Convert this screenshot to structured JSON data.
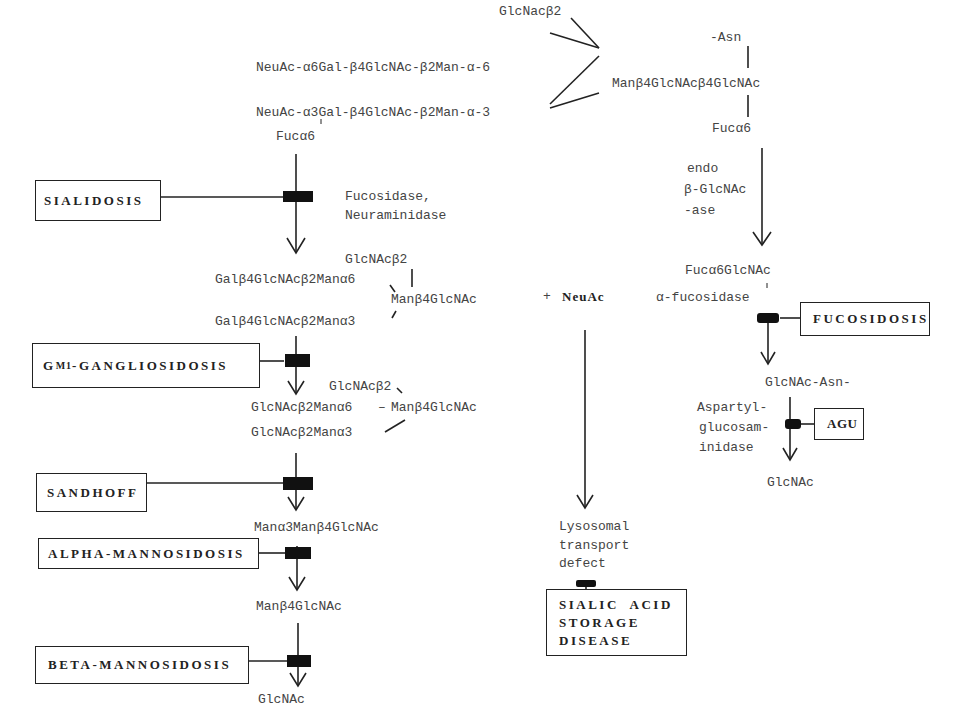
{
  "top": {
    "glcnac_b2": "GlcNacβ2",
    "branch6": "NeuAc-α6Gal-β4GlcNAc-β2Man-α-6",
    "branch3": "NeuAc-α3Gal-β4GlcNAc-β2Man-α-3",
    "fuc_a6_left": "Fucα6",
    "core": "Manβ4GlcNAcβ4GlcNAc",
    "asn": "-Asn",
    "fuc_a6_right": "Fucα6"
  },
  "enzymes": {
    "fucosidase": "Fucosidase,",
    "neuraminidase": "Neuraminidase",
    "endo1": "endo",
    "endo2": "β-GlcNAc",
    "endo3": "-ase",
    "alpha_fucosidase": "α-fucosidase",
    "aga1": "Aspartyl-",
    "aga2": "glucosam-",
    "aga3": "inidase",
    "lyso1": "Lysosomal",
    "lyso2": "transport",
    "lyso3": "defect"
  },
  "intermediates": {
    "s1_glcnac_b2": "GlcNAcβ2",
    "s1_branch6": "Galβ4GlcNAcβ2Manα6",
    "s1_core": "Manβ4GlcNAc",
    "s1_branch3": "Galβ4GlcNAcβ2Manα3",
    "plus_neuac_plus": "+",
    "plus_neuac": "NeuAc",
    "s2_glcnac_b2": "GlcNAcβ2",
    "s2_branch6": "GlcNAcβ2Manα6",
    "s2_dash": "–",
    "s2_core": "Manβ4GlcNAc",
    "s2_branch3": "GlcNAcβ2Manα3",
    "s3": "Manα3Manβ4GlcNAc",
    "s4": "Manβ4GlcNAc",
    "s5": "GlcNAc",
    "r1": "Fucα6GlcNAc",
    "r2": "GlcNAc-Asn-",
    "r3": "GlcNAc"
  },
  "diseases": {
    "sialidosis": "SIALIDOSIS",
    "gm1_prefix": "G",
    "gm1_sub": "M1",
    "gm1_rest": "-GANGLIOSIDOSIS",
    "sandhoff": "SANDHOFF",
    "alpha_mannosidosis": "ALPHA-MANNOSIDOSIS",
    "beta_mannosidosis": "BETA-MANNOSIDOSIS",
    "fucosidosis": "FUCOSIDOSIS",
    "agu": "AGU",
    "sialic_1": "SIALIC  ACID",
    "sialic_2": "STORAGE",
    "sialic_3": "DISEASE"
  }
}
